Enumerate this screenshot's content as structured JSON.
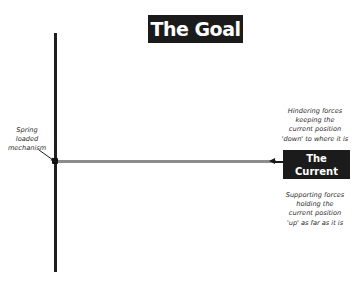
{
  "diagram": {
    "title": "The Goal",
    "current_position_label": [
      "The Current",
      "Position"
    ],
    "annotations": {
      "spring": [
        "Spring",
        "loaded",
        "mechanism"
      ],
      "hindering": [
        "Hindering forces",
        "keeping the",
        "current position",
        "'down' to where it is"
      ],
      "supporting": [
        "Supporting forces",
        "holding the",
        "current position",
        "'up' as far as it is"
      ]
    },
    "colors": {
      "box_background": "#1b1b1b",
      "box_text": "#ffffff",
      "vertical_line": "#1f1f1f",
      "horizontal_line": "#8c8c8c",
      "annotation_text": "#2a2a2a"
    }
  }
}
